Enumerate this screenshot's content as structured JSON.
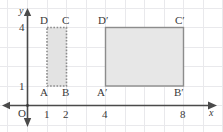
{
  "figure": {
    "kind": "coordinate-plane-dilation-diagram",
    "colors": {
      "grid": "#e9e9ec",
      "axis": "#4a4a4a",
      "shape_stroke": "#8c8c8c",
      "shape_fill": "#e3e3e3",
      "label": "#3a3a3a"
    },
    "axes": {
      "x_label": "x",
      "y_label": "y",
      "origin_label": "O",
      "x_ticks": [
        "1",
        "2",
        "4",
        "8"
      ],
      "y_ticks": [
        "1",
        "4"
      ]
    },
    "shapes": [
      {
        "name": "rectangle-abcd",
        "style": "dotted",
        "vertices": [
          {
            "label": "A",
            "prime": "",
            "x": 1,
            "y": 1
          },
          {
            "label": "B",
            "prime": "",
            "x": 2,
            "y": 1
          },
          {
            "label": "C",
            "prime": "",
            "x": 2,
            "y": 4
          },
          {
            "label": "D",
            "prime": "",
            "x": 1,
            "y": 4
          }
        ]
      },
      {
        "name": "rectangle-abcd-prime",
        "style": "solid",
        "vertices": [
          {
            "label": "A",
            "prime": "′",
            "x": 4,
            "y": 1
          },
          {
            "label": "B",
            "prime": "′",
            "x": 8,
            "y": 1
          },
          {
            "label": "C",
            "prime": "′",
            "x": 8,
            "y": 4
          },
          {
            "label": "D",
            "prime": "′",
            "x": 4,
            "y": 4
          }
        ]
      }
    ],
    "labels": {
      "A": "A",
      "B": "B",
      "C": "C",
      "D": "D",
      "A_prime": "A′",
      "B_prime": "B′",
      "C_prime": "C′",
      "D_prime": "D′",
      "tick_x1": "1",
      "tick_x2": "2",
      "tick_x4": "4",
      "tick_x8": "8",
      "tick_y1": "1",
      "tick_y4": "4",
      "origin": "O",
      "axis_x": "x",
      "axis_y": "y"
    }
  }
}
